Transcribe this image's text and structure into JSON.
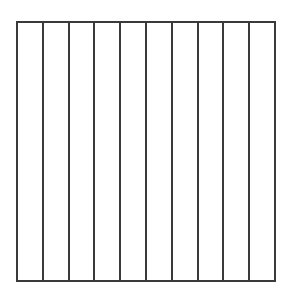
{
  "diagram": {
    "type": "divided-square",
    "orientation": "vertical",
    "strip_count": 10,
    "line_color": "#3a3a3a",
    "background_color": "#ffffff",
    "strips": [
      {
        "index": 1,
        "shaded": false
      },
      {
        "index": 2,
        "shaded": false
      },
      {
        "index": 3,
        "shaded": false
      },
      {
        "index": 4,
        "shaded": false
      },
      {
        "index": 5,
        "shaded": false
      },
      {
        "index": 6,
        "shaded": false
      },
      {
        "index": 7,
        "shaded": false
      },
      {
        "index": 8,
        "shaded": false
      },
      {
        "index": 9,
        "shaded": false
      },
      {
        "index": 10,
        "shaded": false
      }
    ]
  }
}
